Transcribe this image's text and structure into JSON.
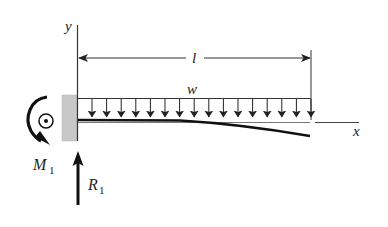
{
  "figure": {
    "type": "cantilever-beam-uniform-load",
    "labels": {
      "y_axis": "y",
      "x_axis": "x",
      "length": "l",
      "load": "w",
      "moment": "M",
      "moment_sub": "1",
      "reaction": "R",
      "reaction_sub": "1"
    },
    "load_arrow_count": 17,
    "colors": {
      "line": "#222222",
      "wall_fill": "#c8c8c8",
      "background": "#ffffff"
    }
  }
}
